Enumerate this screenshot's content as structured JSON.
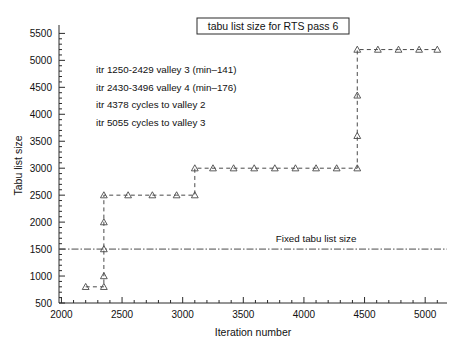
{
  "chart_data": {
    "type": "line",
    "title": "tabu list size for RTS pass 6",
    "xlabel": "Iteration number",
    "ylabel": "Tabu list size",
    "xlim": [
      1980,
      5180
    ],
    "ylim": [
      500,
      5600
    ],
    "xticks": [
      2000,
      2500,
      3000,
      3500,
      4000,
      4500,
      5000
    ],
    "yticks": [
      500,
      1000,
      1500,
      2000,
      2500,
      3000,
      3500,
      4000,
      4500,
      5000,
      5500
    ],
    "x_minor_step": 100,
    "y_minor_step": 100,
    "grid": false,
    "legend": "none",
    "marker": "triangle-up",
    "linestyle": "dashed",
    "series": [
      {
        "name": "tabu list size",
        "points": [
          [
            2200,
            800
          ],
          [
            2350,
            800
          ],
          [
            2350,
            1000
          ],
          [
            2350,
            1500
          ],
          [
            2350,
            2000
          ],
          [
            2350,
            2500
          ],
          [
            2550,
            2500
          ],
          [
            2750,
            2500
          ],
          [
            2950,
            2500
          ],
          [
            3100,
            2500
          ],
          [
            3100,
            3000
          ],
          [
            3250,
            3000
          ],
          [
            3420,
            3000
          ],
          [
            3590,
            3000
          ],
          [
            3760,
            3000
          ],
          [
            3930,
            3000
          ],
          [
            4100,
            3000
          ],
          [
            4270,
            3000
          ],
          [
            4440,
            3000
          ],
          [
            4440,
            3600
          ],
          [
            4440,
            4350
          ],
          [
            4440,
            5200
          ],
          [
            4610,
            5200
          ],
          [
            4780,
            5200
          ],
          [
            4950,
            5200
          ],
          [
            5100,
            5200
          ]
        ]
      }
    ],
    "reference_line": {
      "name": "Fixed tabu list size",
      "label": "Fixed tabu list size",
      "y": 1500,
      "linestyle": "dash-dot",
      "label_x": 4100
    },
    "annotations": [
      "itr 1250-2429 valley 3 (min–141)",
      "itr 2430-3496 valley 4 (min–176)",
      "itr 4378 cycles to valley 2",
      "itr 5055 cycles to valley 3"
    ]
  },
  "colors": {
    "line": "#4a4a4a",
    "axis": "#2b2b2b",
    "text": "#111111",
    "background": "#ffffff"
  }
}
